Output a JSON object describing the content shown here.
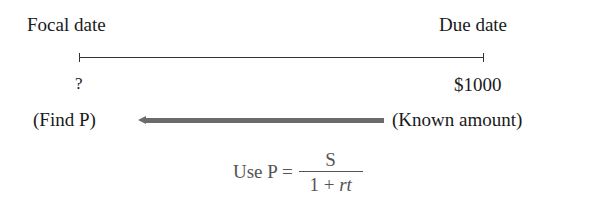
{
  "labels": {
    "focal_date": "Focal date",
    "due_date": "Due date",
    "unknown_value": "?",
    "known_value": "$1000",
    "find_p": "(Find P)",
    "known_amount": "(Known amount)"
  },
  "formula": {
    "prefix": "Use P =",
    "numerator": "S",
    "denominator_prefix": "1 + ",
    "denominator_var": "rt"
  },
  "colors": {
    "text": "#1a1a1a",
    "formula_text": "#555555",
    "arrow": "#6b6b6b"
  }
}
